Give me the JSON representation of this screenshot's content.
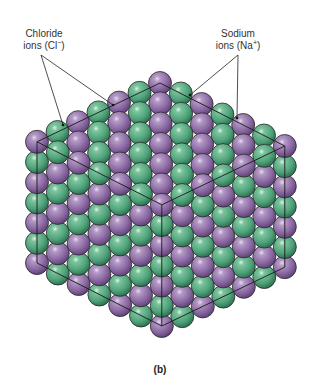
{
  "figure": {
    "caption": "(b)",
    "labels": {
      "chloride": {
        "line1": "Chloride",
        "line2_prefix": "ions (Cl",
        "line2_sup": "−",
        "line2_suffix": ")"
      },
      "sodium": {
        "line1": "Sodium",
        "line2_prefix": "ions (Na",
        "line2_sup": "+",
        "line2_suffix": ")"
      }
    },
    "colors": {
      "chloride": "#9a7ab0",
      "chloride_dark": "#6a4a80",
      "sodium": "#5aae84",
      "sodium_dark": "#2f7a56",
      "outline": "#2a2a2a",
      "cube_edges": "#1a1a1a"
    },
    "lattice": {
      "spheres_per_edge": 7,
      "origin": [
        160,
        83
      ],
      "vec_left": [
        -20.5,
        9.8
      ],
      "vec_right": [
        20.8,
        10.5
      ],
      "vec_down": [
        0,
        20.2
      ],
      "radius": 11.5
    },
    "leaders": {
      "chloride": {
        "from": [
          41,
          55
        ],
        "to": [
          [
            63,
            125
          ],
          [
            113,
            105
          ]
        ]
      },
      "sodium": {
        "from": [
          238,
          55
        ],
        "to": [
          [
            190,
            95
          ],
          [
            237,
            118
          ]
        ]
      }
    }
  }
}
